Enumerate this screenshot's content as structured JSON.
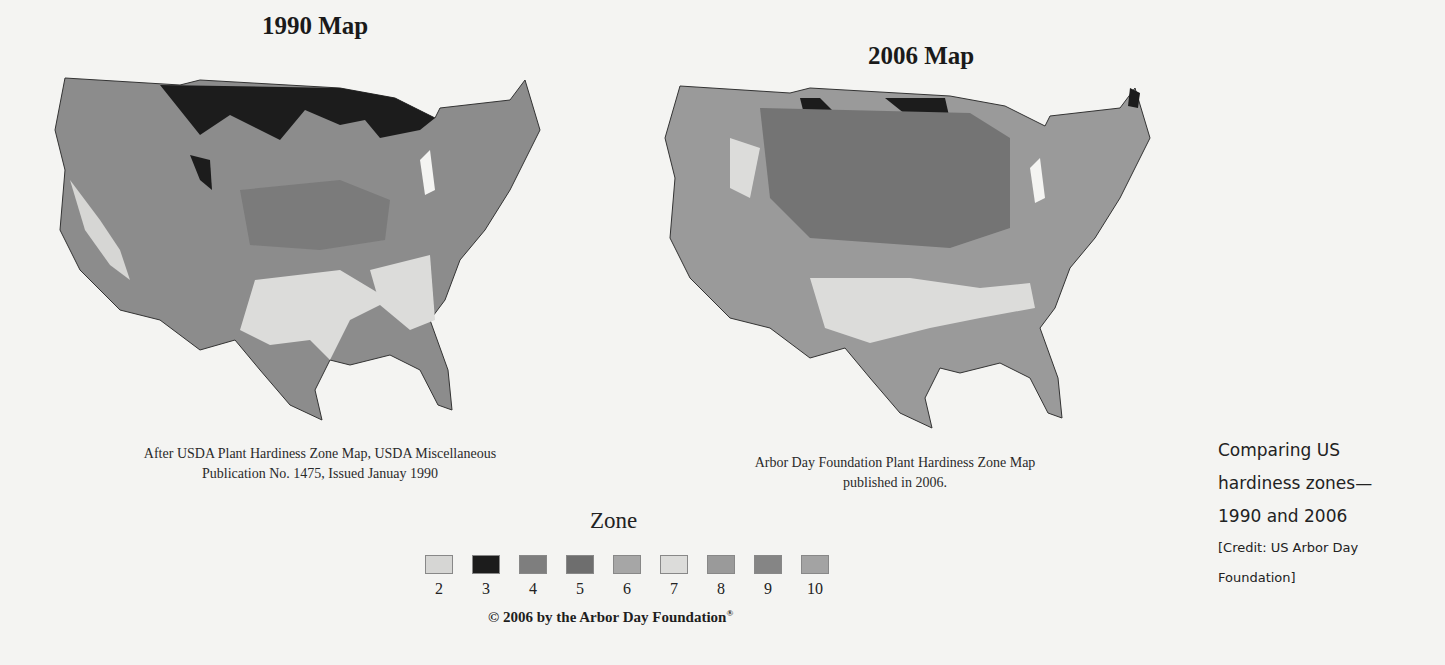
{
  "maps": [
    {
      "title": "1990 Map",
      "caption_line1": "After USDA Plant Hardiness Zone Map, USDA Miscellaneous",
      "caption_line2": "Publication No. 1475, Issued Januay 1990"
    },
    {
      "title": "2006 Map",
      "caption_line1": "Arbor Day Foundation Plant Hardiness Zone Map",
      "caption_line2": "published in 2006."
    }
  ],
  "legend": {
    "title": "Zone",
    "items": [
      {
        "label": "2",
        "color": "#d6d6d4"
      },
      {
        "label": "3",
        "color": "#1c1c1c"
      },
      {
        "label": "4",
        "color": "#7e7e7e"
      },
      {
        "label": "5",
        "color": "#6e6e6e"
      },
      {
        "label": "6",
        "color": "#a6a6a6"
      },
      {
        "label": "7",
        "color": "#dcdcda"
      },
      {
        "label": "8",
        "color": "#9a9a9a"
      },
      {
        "label": "9",
        "color": "#858585"
      },
      {
        "label": "10",
        "color": "#a3a3a3"
      }
    ]
  },
  "copyright": "© 2006 by the Arbor Day Foundation",
  "copyright_mark": "®",
  "side_caption": {
    "line1": "Comparing US",
    "line2": "hardiness zones—",
    "line3": "1990 and 2006",
    "credit_line1": "[Credit: US Arbor Day",
    "credit_line2": "Foundation]"
  }
}
